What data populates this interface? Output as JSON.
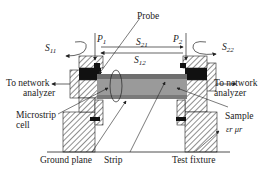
{
  "diagram": {
    "labels": {
      "probe": "Probe",
      "p1": "P",
      "p1_sub": "1",
      "p2": "P",
      "p2_sub": "2",
      "s11": "S",
      "s11_sub": "11",
      "s21": "S",
      "s21_sub": "21",
      "s12": "S",
      "s12_sub": "12",
      "s22": "S",
      "s22_sub": "22",
      "to_network_left_1": "To network",
      "to_network_left_2": "analyzer",
      "to_network_right_1": "To network",
      "to_network_right_2": "analyzer",
      "microstrip_cell_1": "Microstrip",
      "microstrip_cell_2": "cell",
      "sample": "Sample",
      "eps_mu": "εr μr",
      "ground_plane": "Ground  plane",
      "strip": "Strip",
      "test_fixture": "Test fixture"
    },
    "colors": {
      "line": "#222222",
      "hatch": "#444444",
      "connector": "#111111",
      "sample_fill": "#9a9a9a",
      "strip_fill": "#6e6e6e",
      "ground_fill": "#8a8a8a"
    }
  }
}
